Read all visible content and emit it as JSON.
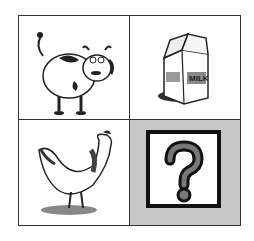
{
  "puzzle": {
    "cells": [
      {
        "name": "cow",
        "icon": "cow-icon"
      },
      {
        "name": "milk carton",
        "icon": "milk-carton-icon",
        "label": "MILK"
      },
      {
        "name": "hen",
        "icon": "hen-icon"
      },
      {
        "name": "unknown",
        "icon": "question-mark-icon",
        "symbol": "?"
      }
    ]
  },
  "colors": {
    "border": "#333333",
    "highlight_bg": "#c8c8c8",
    "question_fill": "#777777"
  }
}
